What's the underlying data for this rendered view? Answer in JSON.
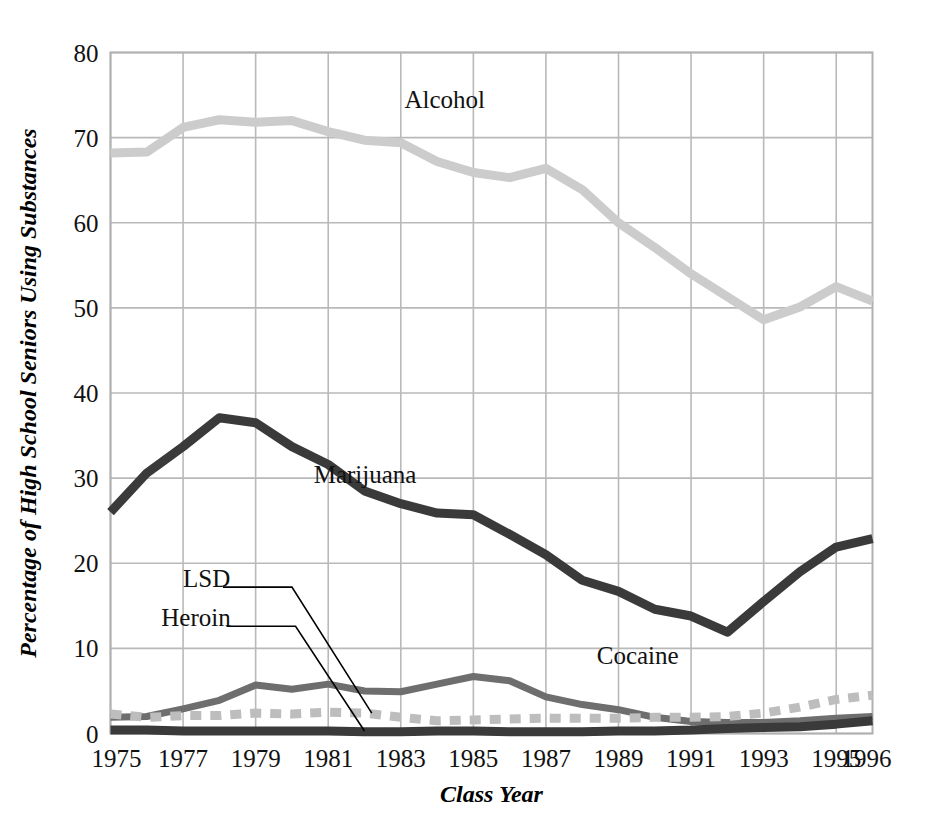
{
  "chart_data": {
    "type": "line",
    "title": "",
    "xlabel": "Class Year",
    "ylabel": "Percentage of High School Seniors Using Substances",
    "xlim": [
      1975,
      1996
    ],
    "ylim": [
      0,
      80
    ],
    "grid": true,
    "legend_position": "inline-labels",
    "x": [
      1975,
      1976,
      1977,
      1978,
      1979,
      1980,
      1981,
      1982,
      1983,
      1984,
      1985,
      1986,
      1987,
      1988,
      1989,
      1990,
      1991,
      1992,
      1993,
      1994,
      1995,
      1996
    ],
    "xticks": [
      "1975",
      "1977",
      "1979",
      "1981",
      "1983",
      "1985",
      "1987",
      "1989",
      "1991",
      "1993",
      "1995",
      "1996"
    ],
    "xtick_values": [
      1975,
      1977,
      1979,
      1981,
      1983,
      1985,
      1987,
      1989,
      1991,
      1993,
      1995,
      1996
    ],
    "yticks": [
      "0",
      "10",
      "20",
      "30",
      "40",
      "50",
      "60",
      "70",
      "80"
    ],
    "ytick_values": [
      0,
      10,
      20,
      30,
      40,
      50,
      60,
      70,
      80
    ],
    "series": [
      {
        "name": "Alcohol",
        "color": "#cccccc",
        "style": "solid",
        "width": 9,
        "label_x": 1983.1,
        "label_y": 73.5,
        "values": [
          68.2,
          68.3,
          71.2,
          72.1,
          71.8,
          72.0,
          70.7,
          69.7,
          69.4,
          67.2,
          65.9,
          65.3,
          66.4,
          63.9,
          60.0,
          57.1,
          54.0,
          51.3,
          48.6,
          50.1,
          52.5,
          50.8
        ]
      },
      {
        "name": "Marijuana",
        "color": "#3a3a3a",
        "style": "solid",
        "width": 9,
        "label_x": 1980.6,
        "label_y": 29.4,
        "values": [
          26.0,
          30.6,
          33.7,
          37.1,
          36.5,
          33.7,
          31.6,
          28.5,
          27.0,
          25.9,
          25.7,
          23.4,
          21.0,
          18.0,
          16.7,
          14.6,
          13.8,
          11.9,
          15.5,
          19.0,
          21.9,
          22.9
        ]
      },
      {
        "name": "Cocaine",
        "color": "#6e6e6e",
        "style": "solid",
        "width": 7,
        "label_x": 1988.4,
        "label_y": 8.2,
        "values": [
          1.9,
          2.0,
          2.9,
          3.9,
          5.7,
          5.2,
          5.8,
          5.0,
          4.9,
          5.8,
          6.7,
          6.2,
          4.3,
          3.4,
          2.8,
          1.9,
          1.4,
          1.3,
          1.3,
          1.5,
          1.8,
          2.0
        ]
      },
      {
        "name": "LSD",
        "color": "#bdbdbd",
        "style": "dashed",
        "width": 9,
        "label_x": 1977.0,
        "label_y": 17.2,
        "values": [
          2.3,
          1.9,
          2.1,
          2.1,
          2.4,
          2.3,
          2.5,
          2.4,
          1.9,
          1.5,
          1.6,
          1.7,
          1.8,
          1.8,
          1.8,
          1.9,
          1.9,
          2.0,
          2.4,
          3.1,
          4.0,
          4.5
        ]
      },
      {
        "name": "Heroin",
        "color": "#3a3a3a",
        "style": "solid",
        "width": 9,
        "label_x": 1976.4,
        "label_y": 12.6,
        "values": [
          0.4,
          0.4,
          0.3,
          0.3,
          0.3,
          0.3,
          0.3,
          0.2,
          0.2,
          0.3,
          0.3,
          0.2,
          0.2,
          0.2,
          0.3,
          0.3,
          0.4,
          0.6,
          0.7,
          0.8,
          1.1,
          1.5
        ]
      }
    ],
    "annotations": [
      {
        "name": "lsd-leader",
        "from_x": 1978.1,
        "from_y": 17.2,
        "elbow_x": 1980.0,
        "elbow_y": 17.2,
        "to_x": 1982.2,
        "to_y": 2.4
      },
      {
        "name": "heroin-leader",
        "from_x": 1978.2,
        "from_y": 12.6,
        "elbow_x": 1980.1,
        "elbow_y": 12.6,
        "to_x": 1982.0,
        "to_y": 0.3
      }
    ]
  }
}
